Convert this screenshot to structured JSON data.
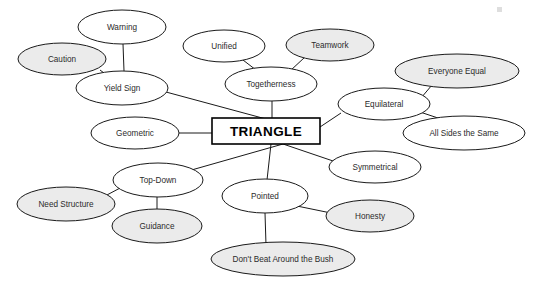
{
  "diagram": {
    "type": "mind-map",
    "title": "TRIANGLE",
    "background_color": "#ffffff",
    "stroke_color": "#1a1a1a",
    "fill_white": "#ffffff",
    "fill_gray": "#ebebeb",
    "center": {
      "label": "TRIANGLE",
      "shape": "rectangle",
      "x": 266,
      "y": 131,
      "width": 108,
      "height": 26,
      "fill": "#ffffff"
    },
    "nodes": [
      {
        "id": "warning",
        "label": "Warning",
        "cx": 122,
        "cy": 27,
        "rx": 44,
        "ry": 17,
        "fill": "#ffffff"
      },
      {
        "id": "caution",
        "label": "Caution",
        "cx": 62,
        "cy": 59,
        "rx": 44,
        "ry": 16,
        "fill": "#ebebeb"
      },
      {
        "id": "yield",
        "label": "Yield Sign",
        "cx": 122,
        "cy": 88,
        "rx": 46,
        "ry": 17,
        "fill": "#ffffff"
      },
      {
        "id": "unified",
        "label": "Unified",
        "cx": 224,
        "cy": 46,
        "rx": 41,
        "ry": 16,
        "fill": "#ffffff"
      },
      {
        "id": "teamwork",
        "label": "Teamwork",
        "cx": 330,
        "cy": 45,
        "rx": 44,
        "ry": 16,
        "fill": "#ebebeb"
      },
      {
        "id": "together",
        "label": "Togetherness",
        "cx": 271,
        "cy": 84,
        "rx": 46,
        "ry": 17,
        "fill": "#ffffff"
      },
      {
        "id": "everyone",
        "label": "Everyone Equal",
        "cx": 457,
        "cy": 71,
        "rx": 62,
        "ry": 17,
        "fill": "#ebebeb"
      },
      {
        "id": "equilat",
        "label": "Equilateral",
        "cx": 384,
        "cy": 104,
        "rx": 46,
        "ry": 16,
        "fill": "#ffffff"
      },
      {
        "id": "allsides",
        "label": "All Sides the Same",
        "cx": 464,
        "cy": 133,
        "rx": 61,
        "ry": 17,
        "fill": "#ffffff"
      },
      {
        "id": "geometric",
        "label": "Geometric",
        "cx": 135,
        "cy": 133,
        "rx": 44,
        "ry": 16,
        "fill": "#ffffff"
      },
      {
        "id": "symmetric",
        "label": "Symmetrical",
        "cx": 375,
        "cy": 167,
        "rx": 46,
        "ry": 16,
        "fill": "#ffffff"
      },
      {
        "id": "topdown",
        "label": "Top-Down",
        "cx": 158,
        "cy": 180,
        "rx": 45,
        "ry": 17,
        "fill": "#ffffff"
      },
      {
        "id": "needstr",
        "label": "Need Structure",
        "cx": 66,
        "cy": 204,
        "rx": 49,
        "ry": 17,
        "fill": "#ebebeb"
      },
      {
        "id": "guidance",
        "label": "Guidance",
        "cx": 157,
        "cy": 226,
        "rx": 45,
        "ry": 17,
        "fill": "#ebebeb"
      },
      {
        "id": "pointed",
        "label": "Pointed",
        "cx": 265,
        "cy": 196,
        "rx": 43,
        "ry": 17,
        "fill": "#ffffff"
      },
      {
        "id": "honesty",
        "label": "Honesty",
        "cx": 370,
        "cy": 216,
        "rx": 44,
        "ry": 16,
        "fill": "#ebebeb"
      },
      {
        "id": "bush",
        "label": "Don't Beat Around the Bush",
        "cx": 283,
        "cy": 259,
        "rx": 72,
        "ry": 17,
        "fill": "#ebebeb"
      }
    ],
    "edges": [
      {
        "from": "warning",
        "to": "yield",
        "x1": 123,
        "y1": 44,
        "x2": 124,
        "y2": 71
      },
      {
        "from": "caution",
        "to": "yield",
        "x1": 100,
        "y1": 70,
        "x2": 108,
        "y2": 76
      },
      {
        "from": "yield",
        "to": "center",
        "x1": 166,
        "y1": 92,
        "x2": 266,
        "y2": 119
      },
      {
        "from": "unified",
        "to": "together",
        "x1": 243,
        "y1": 60,
        "x2": 256,
        "y2": 70
      },
      {
        "from": "teamwork",
        "to": "together",
        "x1": 305,
        "y1": 57,
        "x2": 290,
        "y2": 71
      },
      {
        "from": "together",
        "to": "center",
        "x1": 272,
        "y1": 101,
        "x2": 272,
        "y2": 118
      },
      {
        "from": "everyone",
        "to": "equilat",
        "x1": 432,
        "y1": 85,
        "x2": 410,
        "y2": 111
      },
      {
        "from": "equilat",
        "to": "allsides",
        "x1": 420,
        "y1": 112,
        "x2": 447,
        "y2": 121
      },
      {
        "from": "equilat",
        "to": "center",
        "x1": 341,
        "y1": 113,
        "x2": 320,
        "y2": 127
      },
      {
        "from": "geometric",
        "to": "center",
        "x1": 179,
        "y1": 133,
        "x2": 212,
        "y2": 133
      },
      {
        "from": "center",
        "to": "symmetric",
        "x1": 283,
        "y1": 144,
        "x2": 339,
        "y2": 163
      },
      {
        "from": "center",
        "to": "topdown",
        "x1": 283,
        "y1": 144,
        "x2": 188,
        "y2": 171
      },
      {
        "from": "center",
        "to": "pointed",
        "x1": 271,
        "y1": 144,
        "x2": 267,
        "y2": 180
      },
      {
        "from": "topdown",
        "to": "needstr",
        "x1": 122,
        "y1": 187,
        "x2": 105,
        "y2": 196
      },
      {
        "from": "topdown",
        "to": "guidance",
        "x1": 157,
        "y1": 197,
        "x2": 157,
        "y2": 210
      },
      {
        "from": "pointed",
        "to": "honesty",
        "x1": 292,
        "y1": 205,
        "x2": 331,
        "y2": 213
      },
      {
        "from": "pointed",
        "to": "bush",
        "x1": 265,
        "y1": 213,
        "x2": 266,
        "y2": 245
      }
    ],
    "artifact": {
      "label": "speck-mark",
      "x": 497,
      "y": 7,
      "w": 5,
      "h": 5
    }
  }
}
